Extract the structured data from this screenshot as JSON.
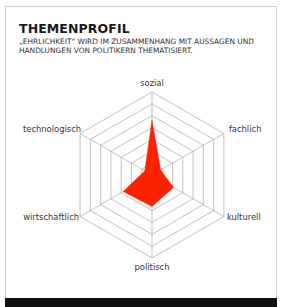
{
  "header": {
    "title": "THEMENPROFIL",
    "subtitle": "„EHRLICHKEIT“ WIRD IM ZUSAMMENHANG MIT AUSSAGEN UND HANDLUNGEN VON POLITIKERN THEMATISIERT."
  },
  "colors": {
    "fill": "#ff2200",
    "grid": "#a8a8a8",
    "footer": "#111111"
  },
  "chart_data": {
    "type": "radar",
    "title": "THEMENPROFIL",
    "subtitle": "„EHRLICHKEIT“ WIRD IM ZUSAMMENHANG MIT AUSSAGEN UND HANDLUNGEN VON POLITIKERN THEMATISIERT.",
    "axes": [
      "sozial",
      "fachlich",
      "kulturell",
      "politisch",
      "wirtschaftlich",
      "technologisch"
    ],
    "rings": 7,
    "range": [
      0,
      1
    ],
    "series": [
      {
        "name": "Ehrlichkeit",
        "values": [
          0.66,
          0.12,
          0.3,
          0.38,
          0.4,
          0.1
        ]
      }
    ],
    "legend": "none",
    "grid": true
  }
}
